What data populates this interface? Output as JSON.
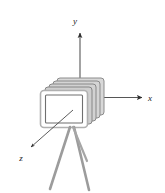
{
  "figure": {
    "background_color": "#ffffff"
  },
  "axes": {
    "origin": {
      "x": 80,
      "y": 97
    },
    "labels": {
      "x": "x",
      "y": "y",
      "z": "z"
    },
    "color": "#3b3b3b",
    "x_axis": {
      "label": "x",
      "direction": "right",
      "start": {
        "x": 95,
        "y": 97
      },
      "end": {
        "x": 142,
        "y": 97
      },
      "label_pos": {
        "x": 150,
        "y": 100
      }
    },
    "y_axis": {
      "label": "y",
      "direction": "up",
      "start": {
        "x": 80,
        "y": 95
      },
      "end": {
        "x": 80,
        "y": 32
      },
      "label_pos": {
        "x": 77,
        "y": 22
      }
    },
    "z_axis": {
      "label": "z",
      "direction": "down-left",
      "start": {
        "x": 72,
        "y": 110
      },
      "end": {
        "x": 29,
        "y": 148
      },
      "label_pos": {
        "x": 19,
        "y": 160
      }
    }
  },
  "camera": {
    "name": "camera-body",
    "front_plane": {
      "x": 40,
      "y": 90,
      "width": 48,
      "height": 38,
      "border_color": "#b5b5b5",
      "fill_color": "#ffffff",
      "inner_border_color": "#8e8e8e"
    },
    "stack": {
      "count": 5,
      "offset_x": 4,
      "offset_y": -3,
      "fill_color": "#d2d2d2",
      "edge_color": "#8a8a8a"
    }
  },
  "tripod": {
    "name": "tripod",
    "color": "#9a9a9a",
    "head": {
      "x": 71,
      "y": 126
    },
    "legs": [
      {
        "name": "tripod-leg-left",
        "x1": 70,
        "y1": 128,
        "x2": 50,
        "y2": 189
      },
      {
        "name": "tripod-leg-right",
        "x1": 74,
        "y1": 128,
        "x2": 89,
        "y2": 190
      },
      {
        "name": "tripod-leg-back",
        "x1": 73,
        "y1": 128,
        "x2": 87,
        "y2": 161
      }
    ]
  },
  "colors": {
    "ink": "#3b3b3b",
    "plane_fill": "#ffffff",
    "plane_stroke": "#b5b5b5",
    "stack_fill": "#d2d2d2",
    "tripod": "#9a9a9a"
  }
}
